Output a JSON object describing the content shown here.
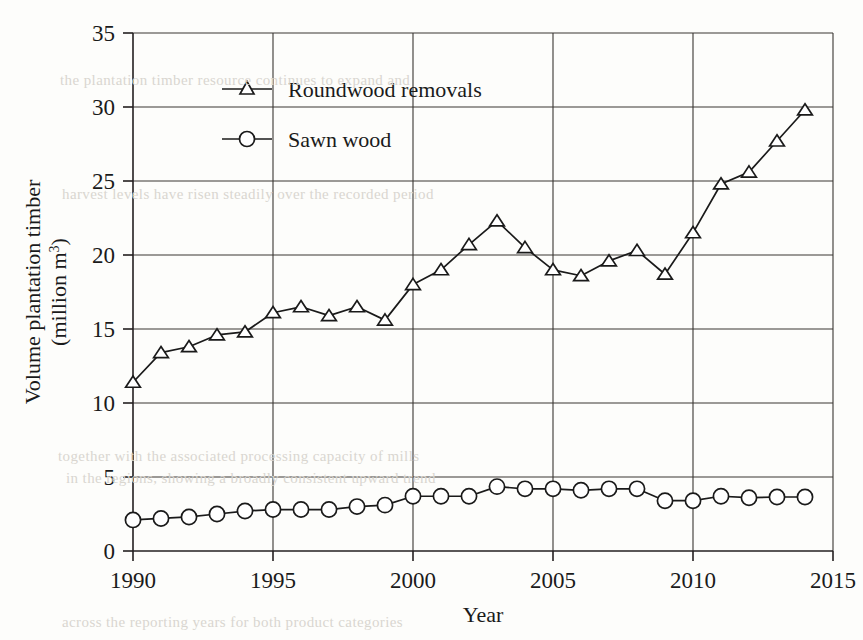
{
  "figure": {
    "background_color": "#fdfdfb",
    "ink_color": "#1a1a1a"
  },
  "chart_data": {
    "type": "line",
    "title": "",
    "xlabel": "Year",
    "ylabel": "Volume plantation timber (million m³)",
    "ylabel_line1": "Volume plantation timber",
    "ylabel_line2": "(million m",
    "ylabel_line2_sup": "3",
    "ylabel_line2_end": ")",
    "xlim": [
      1990,
      2015
    ],
    "ylim": [
      0,
      35
    ],
    "xticks": [
      1990,
      1995,
      2000,
      2005,
      2010,
      2015
    ],
    "xtick_labels": [
      "1990",
      "1995",
      "2000",
      "2005",
      "2010",
      "2015"
    ],
    "yticks": [
      0,
      5,
      10,
      15,
      20,
      25,
      30,
      35
    ],
    "ytick_labels": [
      "0",
      "5",
      "10",
      "15",
      "20",
      "25",
      "30",
      "35"
    ],
    "grid": "both",
    "legend_position": "upper-left-inside",
    "x": [
      1990,
      1991,
      1992,
      1993,
      1994,
      1995,
      1996,
      1997,
      1998,
      1999,
      2000,
      2001,
      2002,
      2003,
      2004,
      2005,
      2006,
      2007,
      2008,
      2009,
      2010,
      2011,
      2012,
      2013,
      2014
    ],
    "series": [
      {
        "name": "Roundwood removals",
        "marker": "triangle",
        "values": [
          11.4,
          13.4,
          13.8,
          14.6,
          14.8,
          16.1,
          16.5,
          15.9,
          16.5,
          15.6,
          18.0,
          19.0,
          20.7,
          22.3,
          20.5,
          19.0,
          18.6,
          19.6,
          20.3,
          18.7,
          21.5,
          24.8,
          25.6,
          27.7,
          29.8
        ]
      },
      {
        "name": "Sawn wood",
        "marker": "circle",
        "values": [
          2.1,
          2.2,
          2.3,
          2.5,
          2.7,
          2.8,
          2.8,
          2.8,
          3.0,
          3.1,
          3.7,
          3.7,
          3.7,
          4.35,
          4.2,
          4.2,
          4.1,
          4.2,
          4.2,
          3.4,
          3.4,
          3.7,
          3.6,
          3.65,
          3.65
        ]
      }
    ]
  },
  "legend": {
    "items": [
      {
        "label": "Roundwood removals",
        "marker": "triangle"
      },
      {
        "label": "Sawn wood",
        "marker": "circle"
      }
    ]
  },
  "background_ghost_text": {
    "lines": [
      "the plantation timber resource continues to expand and",
      "harvest levels have risen steadily over the recorded period",
      "together with the associated processing capacity of mills",
      "in the regions, showing a broadly consistent upward trend",
      "across the reporting years for both product categories"
    ]
  }
}
